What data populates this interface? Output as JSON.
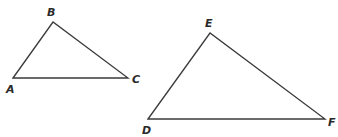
{
  "diagram": {
    "type": "similar-triangles",
    "triangles": [
      {
        "name": "ABC",
        "vertices": [
          {
            "label": "A",
            "x": 13,
            "y": 78,
            "label_x": 6,
            "label_y": 93
          },
          {
            "label": "B",
            "x": 53,
            "y": 22,
            "label_x": 47,
            "label_y": 16
          },
          {
            "label": "C",
            "x": 128,
            "y": 78,
            "label_x": 132,
            "label_y": 83
          }
        ]
      },
      {
        "name": "DEF",
        "vertices": [
          {
            "label": "D",
            "x": 148,
            "y": 119,
            "label_x": 142,
            "label_y": 134
          },
          {
            "label": "E",
            "x": 210,
            "y": 33,
            "label_x": 205,
            "label_y": 27
          },
          {
            "label": "F",
            "x": 325,
            "y": 119,
            "label_x": 328,
            "label_y": 126
          }
        ]
      }
    ],
    "line_color": "#3a3a3a",
    "label_color": "#2a2a2a"
  }
}
